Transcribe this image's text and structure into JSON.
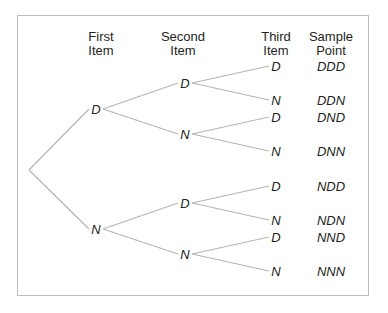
{
  "headers": {
    "first": [
      "First",
      "Item"
    ],
    "second": [
      "Second",
      "Item"
    ],
    "third": [
      "Third",
      "Item"
    ],
    "sample": [
      "Sample",
      "Point"
    ]
  },
  "tree": {
    "level1": [
      "D",
      "N"
    ],
    "level2": [
      "D",
      "N",
      "D",
      "N"
    ],
    "level3": [
      "D",
      "N",
      "D",
      "N",
      "D",
      "N",
      "D",
      "N"
    ]
  },
  "sample_points": [
    "DDD",
    "DDN",
    "DND",
    "DNN",
    "NDD",
    "NDN",
    "NND",
    "NNN"
  ],
  "colors": {
    "edge": "#b5b5b5",
    "border": "#bdbdbd",
    "text": "#231f20"
  }
}
